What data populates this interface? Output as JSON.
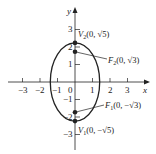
{
  "diagram": {
    "type": "ellipse-graph",
    "equation_implied": "x^2/2 + y^2/5 = 1",
    "axes": {
      "x_label": "x",
      "y_label": "y",
      "x_ticks": [
        "−3",
        "−2",
        "−1",
        "0",
        "1",
        "2",
        "3"
      ],
      "y_ticks": [
        "3",
        "2",
        "1",
        "−1",
        "−2",
        "−3"
      ]
    },
    "points": [
      {
        "name": "V2",
        "label_main": "V",
        "label_sub": "2",
        "label_coord": "(0, √5)"
      },
      {
        "name": "F2",
        "label_main": "F",
        "label_sub": "2",
        "label_coord": "(0, √3)"
      },
      {
        "name": "F1",
        "label_main": "F",
        "label_sub": "1",
        "label_coord": "(0, −√3)"
      },
      {
        "name": "V1",
        "label_main": "V",
        "label_sub": "1",
        "label_coord": "(0, −√5)"
      }
    ],
    "colors": {
      "stroke": "#222222",
      "background": "#ffffff"
    }
  }
}
